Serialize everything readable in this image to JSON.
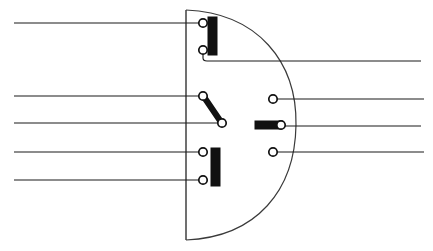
{
  "figure": {
    "canvas": {
      "width": 433,
      "height": 251,
      "background": "#ffffff"
    },
    "colors": {
      "line": "#1b1b1b",
      "boundary": "#2b2b2b",
      "arc": "#3a3a3a",
      "blade_fill": "#111111",
      "node_fill": "#ffffff",
      "node_stroke": "#111111"
    }
  },
  "boundary": {
    "name": "d-shaped-enclosure",
    "vertical_line": {
      "x": 186,
      "y_top": 10,
      "y_bottom": 240
    },
    "arc": {
      "start_x": 186,
      "start_y": 10,
      "end_x": 186,
      "end_y": 240,
      "apex_x": 296,
      "apex_y": 125
    }
  },
  "left_conductors": [
    {
      "id": "left-lead-1",
      "x_start": 14,
      "x_end": 203,
      "y": 23
    },
    {
      "id": "left-lead-2",
      "x_start": 14,
      "x_end": 203,
      "y": 96
    },
    {
      "id": "left-lead-3",
      "x_start": 14,
      "x_end": 222,
      "y": 123
    },
    {
      "id": "left-lead-4",
      "x_start": 14,
      "x_end": 203,
      "y": 152
    },
    {
      "id": "left-lead-5",
      "x_start": 14,
      "x_end": 203,
      "y": 180
    }
  ],
  "right_conductors": [
    {
      "id": "right-lead-1",
      "x_start": 203,
      "x_end": 421,
      "y": 61
    },
    {
      "id": "right-lead-2",
      "x_start": 273,
      "x_end": 424,
      "y": 99
    },
    {
      "id": "right-lead-3",
      "x_start": 281,
      "x_end": 421,
      "y": 126
    },
    {
      "id": "right-lead-4",
      "x_start": 273,
      "x_end": 424,
      "y": 152
    }
  ],
  "jumpers": [
    {
      "id": "jumper-top-elbow",
      "from_x": 203,
      "from_y": 50,
      "corner_x": 203,
      "corner_y": 61,
      "to_x": 421,
      "to_y": 61
    }
  ],
  "terminal_nodes": [
    {
      "id": "node-upper-a",
      "cx": 203,
      "cy": 23,
      "r": 4.2
    },
    {
      "id": "node-upper-b",
      "cx": 203,
      "cy": 50,
      "r": 4.2
    },
    {
      "id": "node-middle-a",
      "cx": 203,
      "cy": 96,
      "r": 4.2
    },
    {
      "id": "node-middle-b",
      "cx": 222,
      "cy": 123,
      "r": 4.2
    },
    {
      "id": "node-lower-a",
      "cx": 203,
      "cy": 152,
      "r": 4.2
    },
    {
      "id": "node-lower-b",
      "cx": 203,
      "cy": 180,
      "r": 4.2
    },
    {
      "id": "node-right-top",
      "cx": 273,
      "cy": 99,
      "r": 4.2
    },
    {
      "id": "node-right-middle",
      "cx": 281,
      "cy": 125,
      "r": 4.2
    },
    {
      "id": "node-right-bottom",
      "cx": 273,
      "cy": 152,
      "r": 4.2
    }
  ],
  "switch_blades": [
    {
      "id": "blade-upper-closed",
      "orientation": "vertical",
      "x": 208,
      "y": 17,
      "width": 9,
      "height": 38,
      "state": "closed"
    },
    {
      "id": "blade-middle-open",
      "orientation": "diagonal",
      "x1": 204,
      "y1": 97,
      "x2": 221,
      "y2": 122,
      "state": "open"
    },
    {
      "id": "blade-lower-closed",
      "orientation": "vertical",
      "x": 211,
      "y": 148,
      "width": 9,
      "height": 38,
      "state": "closed"
    },
    {
      "id": "blade-right-horizontal",
      "orientation": "horizontal",
      "x": 255,
      "y": 121,
      "width": 27,
      "height": 8,
      "state": "closed"
    }
  ],
  "chart_data": {
    "type": "diagram",
    "elements": {
      "left_leads": 5,
      "right_leads": 4,
      "terminal_nodes": 9,
      "switch_blades": 4
    }
  }
}
